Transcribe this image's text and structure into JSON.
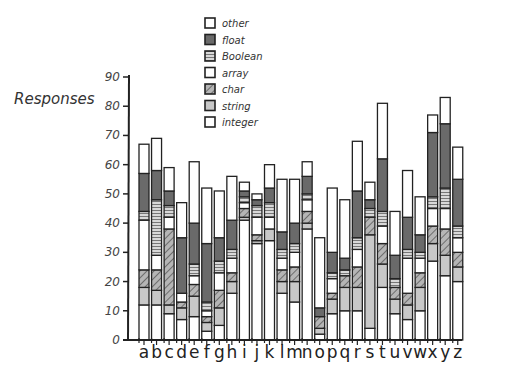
{
  "chart_data": {
    "type": "bar",
    "stacked": true,
    "title": "",
    "xlabel": "",
    "ylabel": "Responses",
    "ylim": [
      0,
      90
    ],
    "yticks": [
      0,
      10,
      20,
      30,
      40,
      50,
      60,
      70,
      80,
      90
    ],
    "grid": false,
    "legend_position": "top-center",
    "categories": [
      "a",
      "b",
      "c",
      "d",
      "e",
      "f",
      "g",
      "h",
      "i",
      "j",
      "k",
      "l",
      "m",
      "n",
      "o",
      "p",
      "q",
      "r",
      "s",
      "t",
      "u",
      "v",
      "w",
      "x",
      "y",
      "z"
    ],
    "series": [
      {
        "name": "integer",
        "fill": "#ffffff",
        "pattern": "none",
        "values": [
          12,
          12,
          9,
          7,
          8,
          3,
          5,
          16,
          41,
          33,
          34,
          16,
          13,
          38,
          2,
          9,
          10,
          10,
          4,
          18,
          9,
          7,
          10,
          27,
          22,
          20
        ]
      },
      {
        "name": "string",
        "fill": "#c8c8c8",
        "pattern": "none",
        "values": [
          6,
          5,
          3,
          4,
          7,
          3,
          6,
          4,
          1,
          1,
          4,
          4,
          7,
          2,
          2,
          5,
          8,
          8,
          32,
          8,
          5,
          5,
          8,
          6,
          7,
          5
        ]
      },
      {
        "name": "char",
        "fill": "#9a9a9a",
        "pattern": "hatch",
        "values": [
          6,
          7,
          26,
          2,
          4,
          2,
          6,
          3,
          3,
          2,
          0,
          4,
          5,
          4,
          4,
          2,
          4,
          7,
          6,
          7,
          4,
          4,
          5,
          6,
          9,
          5
        ]
      },
      {
        "name": "array",
        "fill": "#ffffff",
        "pattern": "none",
        "values": [
          17,
          5,
          4,
          3,
          3,
          2,
          6,
          5,
          2,
          6,
          4,
          4,
          5,
          4,
          0,
          5,
          0,
          6,
          0,
          6,
          0,
          12,
          5,
          6,
          7,
          5
        ]
      },
      {
        "name": "Boolean",
        "fill": "#b0b0b0",
        "pattern": "hlines",
        "values": [
          3,
          19,
          4,
          0,
          4,
          3,
          4,
          3,
          2,
          4,
          5,
          3,
          3,
          2,
          0,
          2,
          2,
          4,
          3,
          5,
          3,
          3,
          2,
          4,
          7,
          4
        ]
      },
      {
        "name": "float",
        "fill": "#6a6a6a",
        "pattern": "none",
        "values": [
          13,
          10,
          5,
          19,
          14,
          20,
          8,
          10,
          2,
          2,
          5,
          6,
          7,
          6,
          3,
          7,
          4,
          16,
          3,
          18,
          8,
          11,
          6,
          22,
          22,
          16
        ]
      },
      {
        "name": "other",
        "fill": "#ffffff",
        "pattern": "none",
        "values": [
          10,
          11,
          8,
          12,
          21,
          19,
          16,
          15,
          3,
          2,
          8,
          18,
          15,
          5,
          24,
          22,
          20,
          17,
          6,
          19,
          15,
          16,
          13,
          6,
          9,
          11
        ]
      }
    ]
  },
  "legend": {
    "items": [
      {
        "label": "other"
      },
      {
        "label": "float"
      },
      {
        "label": "Boolean"
      },
      {
        "label": "array"
      },
      {
        "label": "char"
      },
      {
        "label": "string"
      },
      {
        "label": "integer"
      }
    ]
  },
  "axis": {
    "ylabel": "Responses"
  }
}
